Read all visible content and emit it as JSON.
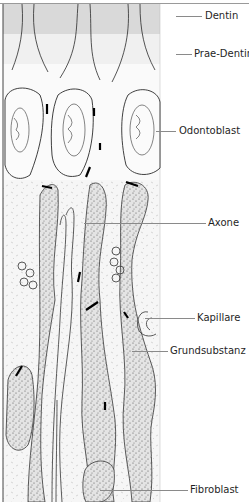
{
  "figure": {
    "type": "histological illustration",
    "colors": {
      "dentin_band": "#d9d9d9",
      "prae_dentin_band": "#f0f0f0",
      "stroke": "#2a2a2a",
      "stipple_fill": "#dcdcdc",
      "junction": "#000000",
      "leader_line": "#8a8a8a"
    }
  },
  "labels": [
    {
      "id": "dentin",
      "text": "Dentin"
    },
    {
      "id": "prae_dentin",
      "text": "Prae-Dentin"
    },
    {
      "id": "odontoblast",
      "text": "Odontoblast"
    },
    {
      "id": "axone",
      "text": "Axone"
    },
    {
      "id": "kapillare",
      "text": "Kapillare"
    },
    {
      "id": "grundsubstanz",
      "text": "Grundsubstanz"
    },
    {
      "id": "fibroblast",
      "text": "Fibroblast"
    }
  ]
}
